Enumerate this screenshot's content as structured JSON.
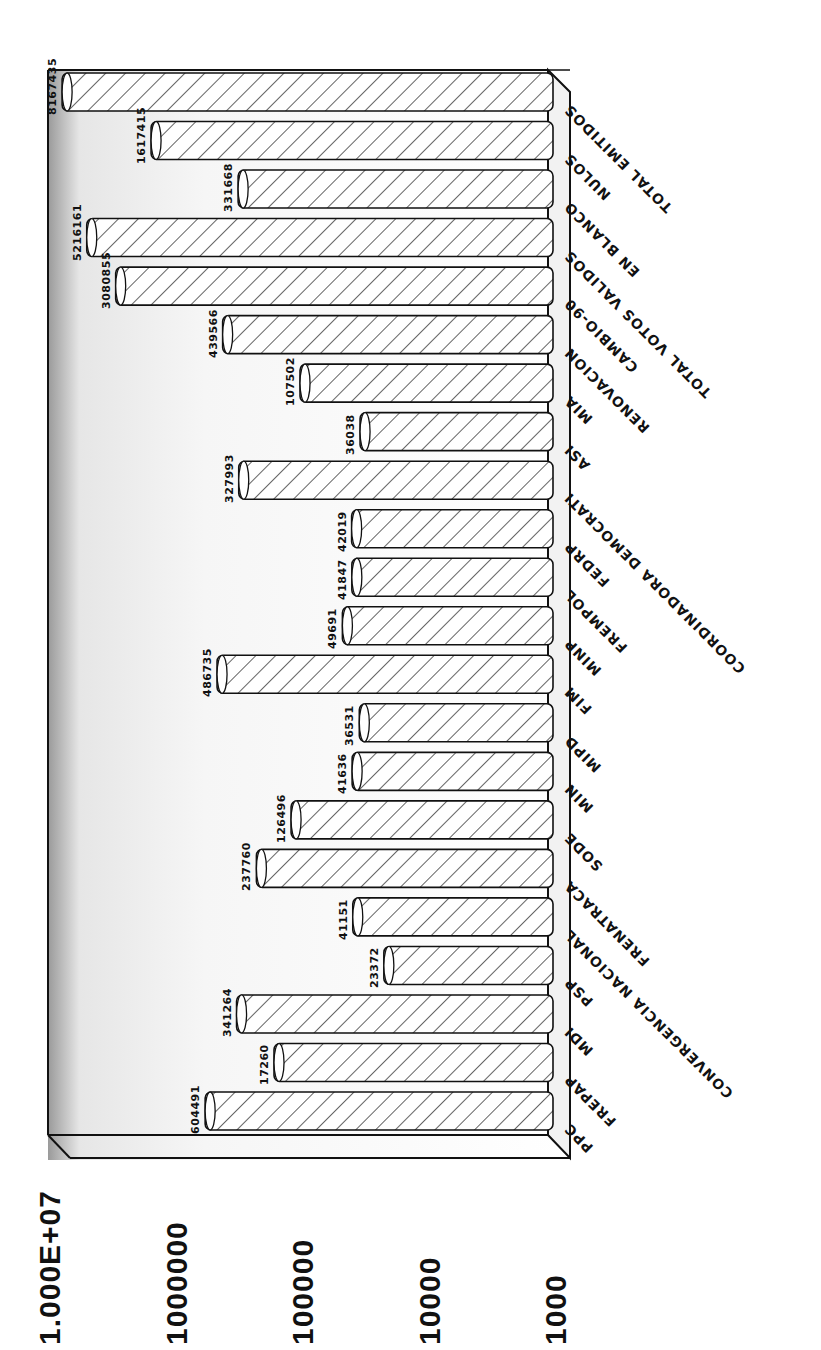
{
  "chart_data": {
    "type": "bar",
    "orientation": "rotated 90deg counter-clockwise (horizontal bars on page)",
    "title": "",
    "xlabel": "",
    "ylabel": "",
    "scale": "log",
    "ylim": [
      1000,
      10000000
    ],
    "y_tick_labels": [
      "1000",
      "10000",
      "100000",
      "1000000",
      "1.000E+07"
    ],
    "grid": false,
    "legend": null,
    "categories": [
      "PPC",
      "FREPAP",
      "MDI",
      "PSP",
      "CONVERGENCIA NACIONAL",
      "FRENATRACA",
      "SODE",
      "MIN",
      "MIPD",
      "FIM",
      "MINP",
      "FREMPOL",
      "FEDRP",
      "COORDINADORA DEMOCRATI",
      "ASI",
      "MIA",
      "RENOVACION",
      "CAMBIO-90",
      "TOTAL VOTOS VALIDOS",
      "EN BLANCO",
      "NULOS",
      "TOTAL EMITIDOS"
    ],
    "value_labels": [
      "604491",
      "17260",
      "341264",
      "23372",
      "41151",
      "237760",
      "126496",
      "41636",
      "36531",
      "486735",
      "49691",
      "41847",
      "42019",
      "327993",
      "36038",
      "107502",
      "439566",
      "3080855",
      "5216161",
      "331668",
      "1617415",
      "8167435"
    ],
    "values": [
      604491,
      172600,
      341264,
      23372,
      41151,
      237760,
      126496,
      41636,
      36531,
      486735,
      49691,
      41847,
      42019,
      327993,
      36038,
      107502,
      439566,
      3080855,
      5216161,
      331668,
      1617415,
      8167435
    ],
    "style": {
      "bar_fill": "diagonal hatch",
      "bar_stroke": "#111111",
      "background": "#ffffff",
      "frame_3d": true
    }
  }
}
